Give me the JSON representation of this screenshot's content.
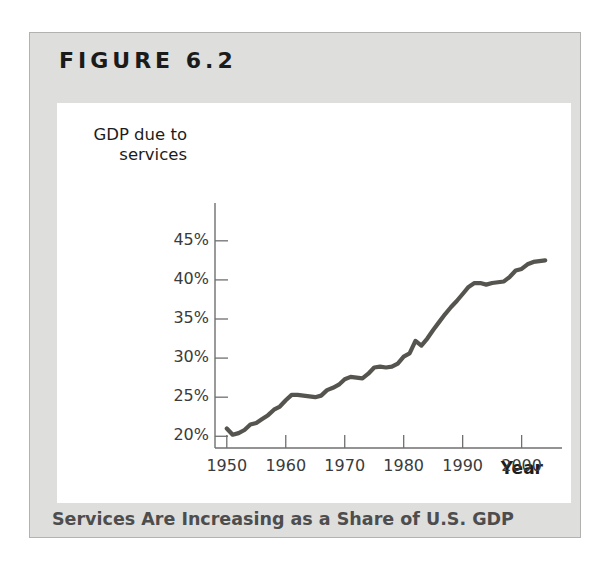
{
  "figure": {
    "title": "FIGURE 6.2",
    "caption": "Services Are Increasing as a Share of U.S. GDP"
  },
  "colors": {
    "panel_background": "#dededd",
    "panel_border": "#b2b2b0",
    "plot_background": "#ffffff",
    "line": "#55544f",
    "axis": "#6f6f6f",
    "tick_text": "#3b3b3b",
    "title_text": "#1b1b1b",
    "caption_text": "#4d4d4d"
  },
  "chart_data": {
    "type": "line",
    "title": "Services Are Increasing as a Share of U.S. GDP",
    "subtitle": "",
    "xlabel": "Year",
    "ylabel": "GDP due to services",
    "xlim": [
      1948,
      2006
    ],
    "ylim": [
      18.5,
      46
    ],
    "grid": false,
    "legend": false,
    "xticks": [
      1950,
      1960,
      1970,
      1980,
      1990,
      2000
    ],
    "xticklabels": [
      "1950",
      "1960",
      "1970",
      "1980",
      "1990",
      "2000"
    ],
    "yticks": [
      20,
      25,
      30,
      35,
      40,
      45
    ],
    "yticklabels": [
      "20%",
      "25%",
      "30%",
      "35%",
      "40%",
      "45%"
    ],
    "series": [
      {
        "name": "GDP due to services",
        "x": [
          1950,
          1951,
          1952,
          1953,
          1954,
          1955,
          1956,
          1957,
          1958,
          1959,
          1960,
          1961,
          1962,
          1963,
          1964,
          1965,
          1966,
          1967,
          1968,
          1969,
          1970,
          1971,
          1972,
          1973,
          1974,
          1975,
          1976,
          1977,
          1978,
          1979,
          1980,
          1981,
          1982,
          1983,
          1984,
          1985,
          1986,
          1987,
          1988,
          1989,
          1990,
          1991,
          1992,
          1993,
          1994,
          1995,
          1996,
          1997,
          1998,
          1999,
          2000,
          2001,
          2002,
          2003,
          2004
        ],
        "values": [
          21.0,
          20.2,
          20.4,
          20.8,
          21.5,
          21.7,
          22.2,
          22.7,
          23.4,
          23.8,
          24.6,
          25.3,
          25.3,
          25.2,
          25.1,
          25.0,
          25.2,
          25.9,
          26.2,
          26.6,
          27.3,
          27.6,
          27.5,
          27.4,
          28.0,
          28.8,
          28.9,
          28.8,
          28.9,
          29.3,
          30.2,
          30.6,
          32.2,
          31.6,
          32.5,
          33.6,
          34.6,
          35.6,
          36.5,
          37.3,
          38.2,
          39.1,
          39.6,
          39.6,
          39.4,
          39.6,
          39.7,
          39.8,
          40.4,
          41.2,
          41.4,
          42.0,
          42.3,
          42.4,
          42.5
        ]
      }
    ],
    "annotations": []
  }
}
